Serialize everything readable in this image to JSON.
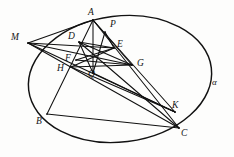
{
  "figure": {
    "background_color": "#fdfdfc",
    "stroke_color": "#101010",
    "conic_stroke_color": "#121212",
    "labels": [
      {
        "name": "label-A",
        "text": "A",
        "x": 88,
        "y": 8
      },
      {
        "name": "label-P",
        "text": "P",
        "x": 110,
        "y": 20
      },
      {
        "name": "label-M",
        "text": "M",
        "x": 11,
        "y": 33
      },
      {
        "name": "label-D",
        "text": "D",
        "x": 68,
        "y": 32
      },
      {
        "name": "label-E",
        "text": "E",
        "x": 117,
        "y": 40
      },
      {
        "name": "label-F",
        "text": "F",
        "x": 65,
        "y": 54
      },
      {
        "name": "label-G",
        "text": "G",
        "x": 137,
        "y": 59
      },
      {
        "name": "label-H",
        "text": "H",
        "x": 57,
        "y": 64
      },
      {
        "name": "label-Q",
        "text": "Q",
        "x": 88,
        "y": 70
      },
      {
        "name": "label-K",
        "text": "K",
        "x": 172,
        "y": 101
      },
      {
        "name": "label-alpha",
        "text": "α",
        "x": 212,
        "y": 78
      },
      {
        "name": "label-B",
        "text": "B",
        "x": 36,
        "y": 117
      },
      {
        "name": "label-C",
        "text": "C",
        "x": 181,
        "y": 129
      }
    ],
    "points": {
      "A": {
        "x": 93,
        "y": 20
      },
      "B": {
        "x": 47,
        "y": 114
      },
      "C": {
        "x": 179,
        "y": 128
      },
      "M": {
        "x": 28,
        "y": 43
      },
      "D": {
        "x": 79,
        "y": 42
      },
      "E": {
        "x": 114,
        "y": 48
      },
      "F": {
        "x": 76,
        "y": 60
      },
      "G": {
        "x": 132,
        "y": 65
      },
      "H": {
        "x": 71,
        "y": 67
      },
      "P": {
        "x": 105,
        "y": 32
      },
      "Q": {
        "x": 93,
        "y": 73
      },
      "K": {
        "x": 175,
        "y": 112
      }
    },
    "conic": {
      "type": "ellipse",
      "center_x": 120,
      "center_y": 79,
      "radius_x": 92,
      "radius_y": 63,
      "rotation_deg": -7
    },
    "segments": [
      {
        "name": "segment-A-B",
        "from": "A",
        "to": "B"
      },
      {
        "name": "segment-A-C",
        "from": "A",
        "to": "C"
      },
      {
        "name": "segment-B-C",
        "from": "B",
        "to": "C"
      },
      {
        "name": "segment-A-Q",
        "from": "A",
        "to": "Q"
      },
      {
        "name": "segment-A-G",
        "from": "A",
        "to": "G"
      },
      {
        "name": "segment-A-K",
        "from": "A",
        "to": "K"
      },
      {
        "name": "segment-M-A",
        "from": "M",
        "to": "A"
      },
      {
        "name": "segment-M-E",
        "from": "M",
        "to": "E"
      },
      {
        "name": "segment-M-G",
        "from": "M",
        "to": "G"
      },
      {
        "name": "segment-M-K",
        "from": "M",
        "to": "K"
      },
      {
        "name": "segment-M-C",
        "from": "M",
        "to": "C"
      },
      {
        "name": "segment-D-E",
        "from": "D",
        "to": "E"
      },
      {
        "name": "segment-D-G",
        "from": "D",
        "to": "G"
      },
      {
        "name": "segment-D-Q",
        "from": "D",
        "to": "Q"
      },
      {
        "name": "segment-F-G",
        "from": "F",
        "to": "G"
      },
      {
        "name": "segment-H-E",
        "from": "H",
        "to": "E"
      },
      {
        "name": "segment-H-K",
        "from": "H",
        "to": "K"
      },
      {
        "name": "segment-P-Q",
        "from": "P",
        "to": "Q"
      },
      {
        "name": "segment-P-E",
        "from": "P",
        "to": "E"
      },
      {
        "name": "segment-Q-K",
        "from": "Q",
        "to": "K"
      },
      {
        "name": "segment-D-C",
        "from": "D",
        "to": "C"
      },
      {
        "name": "segment-H-G",
        "from": "H",
        "to": "G"
      },
      {
        "name": "segment-F-E",
        "from": "F",
        "to": "E"
      }
    ]
  }
}
